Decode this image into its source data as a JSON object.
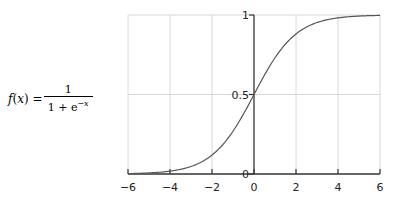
{
  "formula": {
    "lhs_fn": "f",
    "lhs_var": "x",
    "equals": "=",
    "numerator": "1",
    "denominator_base": "1 + e",
    "denominator_exponent": "−x"
  },
  "chart_data": {
    "type": "line",
    "title": "",
    "xlabel": "",
    "ylabel": "",
    "xlim": [
      -6,
      6
    ],
    "ylim": [
      0,
      1
    ],
    "grid": true,
    "x_ticks": [
      -6,
      -4,
      -2,
      0,
      2,
      4,
      6
    ],
    "x_tick_labels": [
      "−6",
      "−4",
      "−2",
      "0",
      "2",
      "4",
      "6"
    ],
    "y_ticks": [
      0,
      0.5,
      1
    ],
    "y_tick_labels": [
      "0",
      "0.5",
      "1"
    ],
    "series": [
      {
        "name": "sigmoid f(x) = 1/(1+e^-x)",
        "x": [
          -6,
          -5,
          -4,
          -3,
          -2,
          -1,
          0,
          1,
          2,
          3,
          4,
          5,
          6
        ],
        "values": [
          0.0025,
          0.0067,
          0.018,
          0.047,
          0.119,
          0.269,
          0.5,
          0.731,
          0.881,
          0.953,
          0.982,
          0.993,
          0.9975
        ],
        "color": "#555555"
      }
    ],
    "colors": {
      "axis": "#333333",
      "grid": "#d8d8d8",
      "curve": "#555555"
    }
  }
}
